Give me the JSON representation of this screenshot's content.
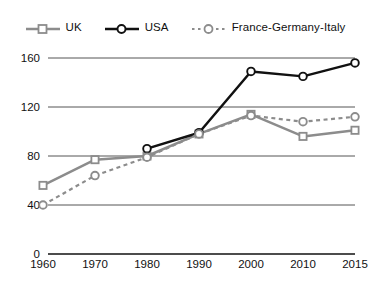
{
  "chart_data": {
    "type": "line",
    "title": "",
    "xlabel": "",
    "ylabel": "",
    "categories": [
      "1960",
      "1970",
      "1980",
      "1990",
      "2000",
      "2010",
      "2015"
    ],
    "ylim": [
      0,
      170
    ],
    "yticks": [
      0,
      40,
      80,
      120,
      160
    ],
    "grid": true,
    "legend_position": "top",
    "series": [
      {
        "name": "UK",
        "color": "#8c8c8c",
        "line_style": "solid",
        "marker": "square",
        "values": [
          56,
          77,
          80,
          98,
          114,
          96,
          101
        ]
      },
      {
        "name": "USA",
        "color": "#111111",
        "line_style": "solid",
        "marker": "circle",
        "values": [
          null,
          null,
          86,
          99,
          149,
          145,
          156
        ]
      },
      {
        "name": "France-Germany-Italy",
        "color": "#8c8c8c",
        "line_style": "dotted",
        "marker": "circle",
        "values": [
          40,
          64,
          79,
          98,
          113,
          108,
          112
        ]
      }
    ]
  },
  "legend": {
    "items": [
      {
        "label": "UK",
        "icon": "line-square-marker-icon"
      },
      {
        "label": "USA",
        "icon": "line-circle-marker-icon"
      },
      {
        "label": "France-Germany-Italy",
        "icon": "dotted-line-circle-marker-icon"
      }
    ]
  },
  "axes": {
    "y_tick_labels": [
      "160",
      "120",
      "80",
      "40",
      "0"
    ],
    "x_tick_labels": [
      "1960",
      "1970",
      "1980",
      "1990",
      "2000",
      "2010",
      "2015"
    ]
  }
}
